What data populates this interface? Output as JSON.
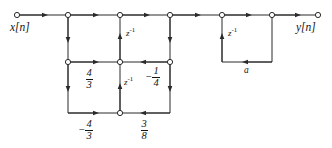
{
  "diagram": {
    "type": "signal-flow-graph",
    "title": "",
    "stroke_color": "#2a2a2a",
    "node_fill": "#ffffff",
    "text_color": "#141414",
    "input_label": "x[n]",
    "output_label": "y[n]",
    "delay_label": "z",
    "delay_exponent": "-1",
    "feedback_gain_label": "a",
    "coefficients": {
      "middle_forward": {
        "sign": "",
        "numerator": "4",
        "denominator": "3"
      },
      "middle_feedback": {
        "sign": "−",
        "numerator": "1",
        "denominator": "4"
      },
      "bottom_forward": {
        "sign": "−",
        "numerator": "4",
        "denominator": "3"
      },
      "bottom_feedback": {
        "sign": "",
        "numerator": "3",
        "denominator": "8"
      }
    },
    "nodes": {
      "top_row_y": 15,
      "middle_row_y": 62,
      "bottom_row_y": 113,
      "top_x": [
        17,
        68,
        120,
        170,
        222,
        272,
        318
      ],
      "lattice_x": [
        68,
        120,
        170
      ],
      "loop_x": [
        222,
        272
      ]
    }
  }
}
